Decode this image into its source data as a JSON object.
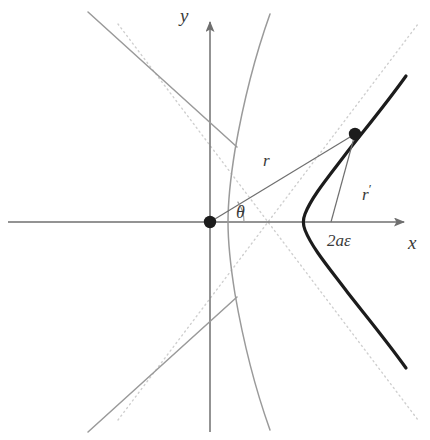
{
  "figure": {
    "type": "geometric-diagram",
    "width": 430,
    "height": 440,
    "background_color": "#ffffff"
  },
  "colors": {
    "axis": "#6f6f6f",
    "curve_near_branch": "#1c1c1c",
    "curve_far_branch": "#8e8e8e",
    "asymptote_dotted": "#c9c9c9",
    "radius_line": "#6f6f6f",
    "point_fill": "#1c1c1c",
    "label_text": "#3a3a3a"
  },
  "axes": {
    "x_label": "x",
    "y_label": "y",
    "origin_px": {
      "x": 210,
      "y": 222
    },
    "x_axis_from_px": {
      "x": 8,
      "y": 222
    },
    "x_axis_to_px": {
      "x": 414,
      "y": 222
    },
    "y_axis_from_px": {
      "x": 210,
      "y": 430
    },
    "y_axis_to_px": {
      "x": 210,
      "y": 12
    },
    "x_label_px": {
      "x": 408,
      "y": 234
    },
    "y_label_px": {
      "x": 180,
      "y": 8
    },
    "arrowheads": [
      "x-positive",
      "y-positive"
    ]
  },
  "labels": {
    "radius_from_focus": "r",
    "radius_from_focus_px": {
      "x": 263,
      "y": 153
    },
    "radius_from_directrix": "r",
    "radius_from_directrix_prime": "′",
    "radius_from_directrix_px": {
      "x": 362,
      "y": 182
    },
    "angle": "θ",
    "angle_px": {
      "x": 236,
      "y": 205
    },
    "segment": "2aε",
    "segment_px": {
      "x": 327,
      "y": 233
    }
  },
  "geometry": {
    "focus_px": {
      "x": 210,
      "y": 222
    },
    "hyperbola_center_px": {
      "x": 268,
      "y": 222
    },
    "near_vertex_px": {
      "x": 303,
      "y": 222
    },
    "far_vertex_px": {
      "x": 228,
      "y": 222
    },
    "point_on_curve_px": {
      "x": 355,
      "y": 134
    },
    "perpendicular_foot_px": {
      "x": 331,
      "y": 222
    },
    "semi_major_axis_px": 35,
    "center_to_focus_px": 58,
    "semi_minor_axis_px": 46.3,
    "eccentricity": 1.657,
    "angle_theta_degrees": 36.5,
    "angle_arc_radius_px": 34,
    "point_dot_radius_px": 6,
    "focus_dot_radius_px": 6,
    "asymptote_slope": 1.32
  },
  "elements": [
    {
      "name": "x-axis",
      "kind": "arrow-line"
    },
    {
      "name": "y-axis",
      "kind": "arrow-line"
    },
    {
      "name": "near-branch",
      "kind": "hyperbola-branch",
      "style": "thick-dark"
    },
    {
      "name": "far-branch",
      "kind": "hyperbola-branch",
      "style": "thin-gray"
    },
    {
      "name": "asymptote-up",
      "kind": "dotted-line"
    },
    {
      "name": "asymptote-down",
      "kind": "dotted-line"
    },
    {
      "name": "focal-radius",
      "kind": "segment"
    },
    {
      "name": "directrix-radius",
      "kind": "segment"
    },
    {
      "name": "angle-arc",
      "kind": "arc"
    },
    {
      "name": "focus-point",
      "kind": "dot"
    },
    {
      "name": "orbit-point",
      "kind": "dot"
    }
  ]
}
